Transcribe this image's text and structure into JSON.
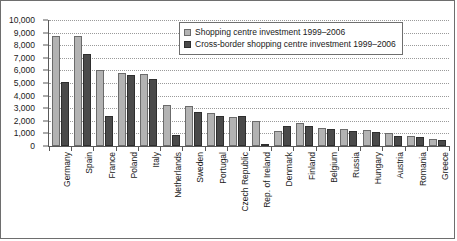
{
  "chart_data": {
    "type": "bar",
    "title": "",
    "xlabel": "",
    "ylabel": "",
    "ylim": [
      0,
      10000
    ],
    "ytick_step": 1000,
    "ytick_labels": [
      "0",
      "1,000",
      "2,000",
      "3,000",
      "4,000",
      "5,000",
      "6,000",
      "7,000",
      "8,000",
      "9,000",
      "10,000"
    ],
    "grid": true,
    "legend_position": "upper-right",
    "categories": [
      "Germany",
      "Spain",
      "France",
      "Poland",
      "Italy",
      "Netherlands",
      "Sweden",
      "Portugal",
      "Czech Republic",
      "Rep. of Ireland",
      "Denmark",
      "Finland",
      "Belgium",
      "Russia",
      "Hungary",
      "Austria",
      "Romania",
      "Greece"
    ],
    "series": [
      {
        "name": "Shopping centre investment 1999–2006",
        "color": "#b3b3b3",
        "values": [
          8700,
          8700,
          6000,
          5800,
          5700,
          3250,
          3200,
          2600,
          2300,
          2000,
          1200,
          1800,
          1450,
          1350,
          1250,
          1000,
          800,
          550
        ]
      },
      {
        "name": "Cross-border shopping centre investment 1999–2006",
        "color": "#4a4a4a",
        "values": [
          5100,
          7300,
          2400,
          5600,
          5300,
          900,
          2700,
          2400,
          2400,
          100,
          1600,
          1550,
          1350,
          1200,
          1150,
          800,
          750,
          500
        ]
      }
    ]
  },
  "legend": {
    "items": [
      {
        "label": "Shopping centre investment 1999–2006",
        "swatch": "light"
      },
      {
        "label": "Cross-border shopping centre investment 1999–2006",
        "swatch": "dark"
      }
    ]
  }
}
